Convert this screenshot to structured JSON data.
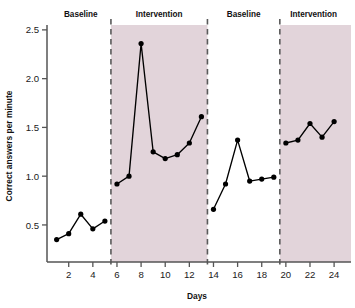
{
  "chart_data": {
    "type": "line",
    "title": "",
    "xlabel": "Days",
    "ylabel": "Correct answers per minute",
    "xlim": [
      0.2,
      25.4
    ],
    "ylim": [
      0.12,
      2.55
    ],
    "grid": false,
    "legend": "none",
    "x_ticks": [
      2,
      4,
      6,
      8,
      10,
      12,
      14,
      16,
      18,
      20,
      22,
      24
    ],
    "y_ticks": [
      0.5,
      1.0,
      1.5,
      2.0,
      2.5
    ],
    "y_tick_labels": [
      "0.5",
      "1.0",
      "1.5",
      "2.0",
      "2.5"
    ],
    "x_tick_labels": [
      "2",
      "4",
      "6",
      "8",
      "10",
      "12",
      "14",
      "16",
      "18",
      "20",
      "22",
      "24"
    ],
    "marker": "filled-circle",
    "line_color": "#000000",
    "shade_color": "#e2d4da",
    "divider_color": "#5a5a5a",
    "phases": [
      {
        "name": "Baseline",
        "label": "Baseline",
        "shaded": false,
        "x_start": 0.4,
        "x_end": 5.5,
        "label_x": 3.0,
        "x": [
          1,
          2,
          3,
          4,
          5
        ],
        "values": [
          0.35,
          0.41,
          0.61,
          0.46,
          0.54
        ]
      },
      {
        "name": "Intervention",
        "label": "Intervention",
        "shaded": true,
        "x_start": 5.5,
        "x_end": 13.5,
        "label_x": 9.5,
        "x": [
          6,
          7,
          8,
          9,
          10,
          11,
          12,
          13
        ],
        "values": [
          0.92,
          1.0,
          2.36,
          1.25,
          1.18,
          1.22,
          1.34,
          1.61
        ]
      },
      {
        "name": "Baseline",
        "label": "Baseline",
        "shaded": false,
        "x_start": 13.5,
        "x_end": 19.5,
        "label_x": 16.5,
        "x": [
          14,
          15,
          16,
          17,
          18,
          19
        ],
        "values": [
          0.66,
          0.92,
          1.37,
          0.95,
          0.97,
          0.99
        ]
      },
      {
        "name": "Intervention",
        "label": "Intervention",
        "shaded": true,
        "x_start": 19.5,
        "x_end": 25.4,
        "label_x": 22.3,
        "x": [
          20,
          21,
          22,
          23,
          24
        ],
        "values": [
          1.34,
          1.37,
          1.54,
          1.4,
          1.56
        ]
      }
    ],
    "dividers": [
      5.5,
      13.5,
      19.5
    ]
  }
}
